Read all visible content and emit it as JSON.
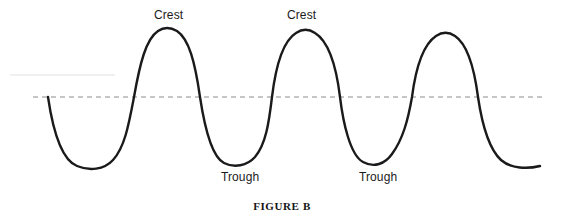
{
  "figure": {
    "caption": "FIGURE B",
    "background_color": "#ffffff",
    "curve_color": "#1a1a1a",
    "midline_color": "#8c8c8c",
    "label_color": "#1a1a1a"
  },
  "labels": {
    "crest_1": "Crest",
    "crest_2": "Crest",
    "trough_1": "Trough",
    "trough_2": "Trough"
  },
  "chart_data": {
    "type": "line",
    "title": "FIGURE B",
    "xlabel": "",
    "ylabel": "",
    "grid": false,
    "legend_position": "none",
    "annotations": [
      {
        "text": "Crest",
        "x": 165,
        "y": 16,
        "points_to": "first crest peak"
      },
      {
        "text": "Crest",
        "x": 305,
        "y": 16,
        "points_to": "second crest peak"
      },
      {
        "text": "Trough",
        "x": 243,
        "y": 178,
        "points_to": "second trough bottom"
      },
      {
        "text": "Trough",
        "x": 381,
        "y": 178,
        "points_to": "third trough bottom"
      }
    ],
    "midline": {
      "y": 97,
      "x_start": 33,
      "x_end": 546,
      "style": "dashed"
    },
    "wave_path_points": [
      {
        "x": 48,
        "y": 97,
        "kind": "zero-crossing-start"
      },
      {
        "x": 95,
        "y": 168,
        "kind": "trough"
      },
      {
        "x": 132,
        "y": 97,
        "kind": "zero-crossing"
      },
      {
        "x": 165,
        "y": 28,
        "kind": "crest"
      },
      {
        "x": 200,
        "y": 97,
        "kind": "zero-crossing"
      },
      {
        "x": 232,
        "y": 164,
        "kind": "trough"
      },
      {
        "x": 272,
        "y": 97,
        "kind": "zero-crossing"
      },
      {
        "x": 305,
        "y": 30,
        "kind": "crest"
      },
      {
        "x": 340,
        "y": 97,
        "kind": "zero-crossing"
      },
      {
        "x": 372,
        "y": 163,
        "kind": "trough"
      },
      {
        "x": 412,
        "y": 97,
        "kind": "zero-crossing"
      },
      {
        "x": 445,
        "y": 33,
        "kind": "crest"
      },
      {
        "x": 478,
        "y": 97,
        "kind": "zero-crossing"
      },
      {
        "x": 540,
        "y": 166,
        "kind": "trough-end"
      }
    ],
    "crests": 3,
    "troughs": 4,
    "ylim": [
      168,
      28
    ],
    "xlim": [
      48,
      540
    ]
  },
  "svg": {
    "wave_path": "M 48,97 C 53,131 62,160 77,166 C 89,171 104,170 113,160 C 125,147 129,123 134,97 C 140,63 146,39 158,31 C 164,27 170,27 177,31 C 189,39 195,62 200,97 C 205,130 212,157 224,163 C 234,168 247,166 255,157 C 266,144 269,122 272,97 C 276,64 283,41 296,33 C 302,29 309,29 315,33 C 328,41 336,64 340,97 C 343,122 350,155 363,162 C 374,168 385,164 392,154 C 403,139 408,120 412,97 C 416,66 424,44 436,36 C 442,32 449,32 455,36 C 467,44 474,66 478,97 C 482,124 489,149 501,160 C 511,169 528,169 540,166",
    "midline_path": "M 33,97 L 546,97",
    "artifact_path": "M 10,75 L 115,75"
  }
}
